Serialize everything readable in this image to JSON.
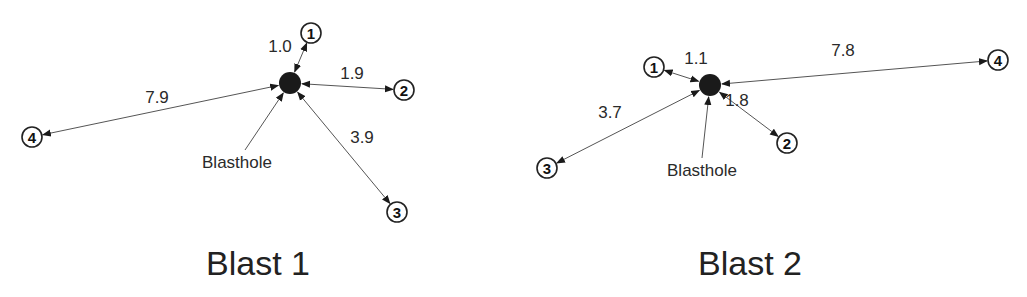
{
  "diagrams": [
    {
      "title": "Blast 1",
      "blasthole": {
        "label": "Blasthole",
        "x": 290,
        "y": 83,
        "label_x": 237,
        "label_y": 168
      },
      "title_pos": {
        "x": 258,
        "y": 275
      },
      "monitors": [
        {
          "id": "1",
          "distance": "1.0",
          "x": 311,
          "y": 33,
          "label_x": 280,
          "label_y": 52
        },
        {
          "id": "2",
          "distance": "1.9",
          "x": 404,
          "y": 90,
          "label_x": 352,
          "label_y": 79
        },
        {
          "id": "3",
          "distance": "3.9",
          "x": 397,
          "y": 212,
          "label_x": 362,
          "label_y": 143
        },
        {
          "id": "4",
          "distance": "7.9",
          "x": 32,
          "y": 137,
          "label_x": 157,
          "label_y": 103
        }
      ]
    },
    {
      "title": "Blast 2",
      "blasthole": {
        "label": "Blasthole",
        "x": 710,
        "y": 85,
        "label_x": 702,
        "label_y": 176
      },
      "title_pos": {
        "x": 750,
        "y": 275
      },
      "monitors": [
        {
          "id": "1",
          "distance": "1.1",
          "x": 654,
          "y": 67,
          "label_x": 696,
          "label_y": 64
        },
        {
          "id": "2",
          "distance": "1.8",
          "x": 787,
          "y": 143,
          "label_x": 737,
          "label_y": 106
        },
        {
          "id": "3",
          "distance": "3.7",
          "x": 547,
          "y": 168,
          "label_x": 610,
          "label_y": 118
        },
        {
          "id": "4",
          "distance": "7.8",
          "x": 998,
          "y": 60,
          "label_x": 843,
          "label_y": 56
        }
      ]
    }
  ],
  "colors": {
    "line": "#555555",
    "node_stroke": "#222222",
    "blasthole_fill": "#1a1a1a",
    "text": "#2a2a2a"
  }
}
